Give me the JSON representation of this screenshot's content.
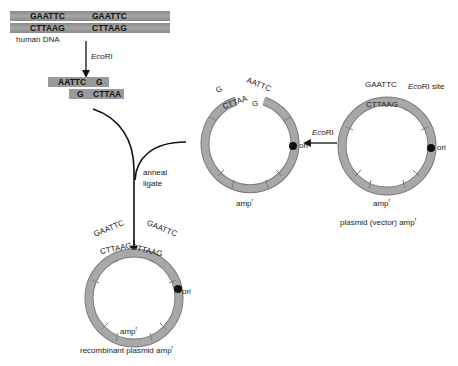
{
  "human_dna": {
    "top_strand": [
      "GAATTC",
      "GAATTC"
    ],
    "bottom_strand": [
      "CTTAAG",
      "CTTAAG"
    ],
    "label": "human DNA"
  },
  "step1_enzyme": {
    "italic": "Eco",
    "regular": "RI"
  },
  "fragment": {
    "top": [
      "AATTC",
      "G"
    ],
    "bottom": [
      "G",
      "CTTAA"
    ]
  },
  "cut_plasmid": {
    "left_end_top": "G",
    "left_end_bottom": "CTTAA",
    "right_end_top": "AATTC",
    "right_end_bottom": "G",
    "ori_label": "ori",
    "amp_label": "amp",
    "amp_superscript": "r"
  },
  "step2_enzyme": {
    "italic": "Eco",
    "regular": "RI"
  },
  "vector_plasmid": {
    "site_top": "GAATTC",
    "site_bottom": "CTTAAG",
    "site_label_italic": "Eco",
    "site_label_regular": "RI site",
    "ori_label": "ori",
    "amp_label": "amp",
    "amp_superscript": "r",
    "caption": "plasmid (vector) amp",
    "caption_superscript": "r"
  },
  "step3_label": [
    "anneal",
    "ligate"
  ],
  "recombinant_plasmid": {
    "site1_top": "GAATTC",
    "site1_bottom": "CTTAAG",
    "site2_top": "GAATTC",
    "site2_bottom": "CTTAAG",
    "ori_label": "ori",
    "amp_label": "amp",
    "amp_superscript": "r",
    "caption": "recombinant plasmid amp",
    "caption_superscript": "r"
  },
  "colors": {
    "ring": "#9e9e9e",
    "ring_stroke": "#7a7a7a",
    "dna_band": "#999999",
    "ori_dot": "#111111",
    "arrow": "#111111"
  }
}
